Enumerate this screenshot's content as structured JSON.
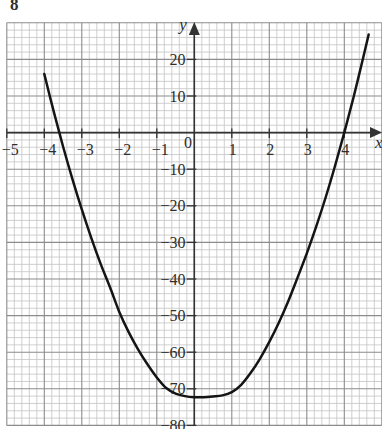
{
  "question_number": "8",
  "colors": {
    "background": "#ffffff",
    "curve": "#141414",
    "axis": "#333333",
    "grid_major": "#8c8c8c",
    "grid_minor": "#c4c4c4",
    "text": "#2e2e2e"
  },
  "chart_data": {
    "type": "line",
    "title": "",
    "xlabel": "x",
    "ylabel": "y",
    "origin_label": "0",
    "xlim": [
      -5,
      5
    ],
    "ylim": [
      -80,
      30
    ],
    "grid": true,
    "grid_minor_step": {
      "x": 0.2,
      "y": 2
    },
    "grid_major_step": {
      "x": 1,
      "y": 10
    },
    "legend": null,
    "x_ticks": [
      -5,
      -4,
      -3,
      -2,
      -1,
      1,
      2,
      3,
      4
    ],
    "x_tick_labels": [
      "−5",
      "−4",
      "−3",
      "−2",
      "−1",
      "1",
      "2",
      "3",
      "4"
    ],
    "y_ticks": [
      20,
      10,
      -10,
      -20,
      -30,
      -40,
      -50,
      -60,
      -70,
      -80
    ],
    "y_tick_labels": [
      "20",
      "10",
      "−10",
      "−20",
      "−30",
      "−40",
      "−50",
      "−60",
      "−70",
      "−80"
    ],
    "series": [
      {
        "name": "curve",
        "x": [
          -4,
          -3.75,
          -3.5,
          -3.25,
          -3,
          -2.75,
          -2.5,
          -2.25,
          -2,
          -1.75,
          -1.5,
          -1.25,
          -1,
          -0.75,
          -0.5,
          -0.25,
          0,
          0.25,
          0.5,
          0.75,
          1,
          1.25,
          1.5,
          1.75,
          2,
          2.25,
          2.5,
          2.75,
          3,
          3.25,
          3.5,
          3.75,
          4,
          4.25,
          4.5,
          4.65
        ],
        "y": [
          16,
          5.8,
          -3.8,
          -12.7,
          -21,
          -28.7,
          -35.8,
          -42.2,
          -49,
          -54.5,
          -59.2,
          -63.3,
          -66.9,
          -69.8,
          -71.3,
          -72,
          -72.3,
          -72.3,
          -72.1,
          -71.8,
          -70.9,
          -68.9,
          -65.7,
          -61.8,
          -57.2,
          -52,
          -46.2,
          -39.7,
          -33,
          -25.7,
          -17.8,
          -9.2,
          0,
          9.8,
          20.3,
          26.8
        ]
      }
    ],
    "annotations": [
      {
        "text": "x-intercepts",
        "x": [
          -3.6,
          4
        ]
      },
      {
        "text": "minimum",
        "x": 0.2,
        "y": -72
      }
    ]
  }
}
